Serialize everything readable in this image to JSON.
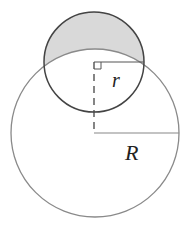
{
  "diagram": {
    "type": "geometry",
    "labels": {
      "small_radius": "r",
      "large_radius": "R"
    },
    "colors": {
      "shaded_region": "#d9d9d9",
      "small_circle_stroke": "#444444",
      "large_circle_stroke": "#888888",
      "label": "#222222"
    },
    "elements": [
      "small-circle",
      "large-circle",
      "shaded-lune",
      "small-radius-line",
      "large-radius-line",
      "dashed-center-line",
      "right-angle-marker"
    ]
  }
}
